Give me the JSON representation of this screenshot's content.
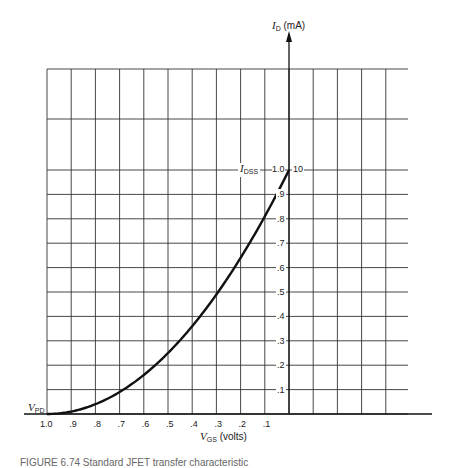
{
  "chart_data": {
    "type": "line",
    "title": "Standard JFET transfer characteristic",
    "xlabel_symbol": "V",
    "xlabel_sub": "GS",
    "xlabel_unit": "(volts)",
    "ylabel_symbol": "I",
    "ylabel_sub": "D",
    "ylabel_unit": "(mA)",
    "x_tick_labels": [
      "1.0",
      ".9",
      ".8",
      ".7",
      ".6",
      ".5",
      ".4",
      ".3",
      ".2",
      ".1"
    ],
    "y_tick_labels_left": [
      ".1",
      ".2",
      ".3",
      ".4",
      ".5",
      ".6",
      ".7",
      ".8",
      ".9",
      "1.0"
    ],
    "y_tick_labels_right": [
      "10"
    ],
    "annotations": [
      {
        "text_symbol": "I",
        "text_sub": "DSS",
        "at": "y=1.0"
      },
      {
        "text_symbol": "V",
        "text_sub": "PD",
        "at": "x=1.0"
      }
    ],
    "x_note": "x axis is normalized |VGS/VP|, decreasing from 1.0 at left to 0 at the ID axis",
    "y_note": "y axis is normalized ID/IDSS (left labels), 10 mA at IDSS",
    "series": [
      {
        "name": "ID/IDSS",
        "x": [
          1.0,
          0.9,
          0.8,
          0.7,
          0.6,
          0.5,
          0.4,
          0.3,
          0.2,
          0.1,
          0.0
        ],
        "y": [
          0.0,
          0.01,
          0.04,
          0.09,
          0.16,
          0.25,
          0.36,
          0.49,
          0.64,
          0.81,
          1.0
        ]
      }
    ],
    "xlim": [
      1.0,
      -0.5
    ],
    "ylim": [
      0,
      1.2
    ],
    "grid": true,
    "legend": "none"
  },
  "labels": {
    "id_axis_symbol": "I",
    "id_axis_sub": "D",
    "id_axis_unit": " (mA)",
    "idss_symbol": "I",
    "idss_sub": "DSS",
    "vpd_symbol": "V",
    "vpd_sub": "PD",
    "vgs_symbol": "V",
    "vgs_sub": "GS",
    "vgs_unit": " (volts)",
    "ten_ma": "10",
    "caption": "FIGURE 6.74   Standard JFET transfer characteristic"
  }
}
